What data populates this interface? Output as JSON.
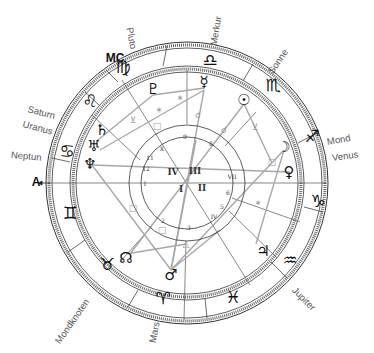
{
  "chart_title": "",
  "planet_labels": [
    {
      "id": "pluto",
      "label": "Pluto",
      "x": 130,
      "y": 22,
      "rot": 80
    },
    {
      "id": "merkur",
      "label": "Merkur",
      "x": 213,
      "y": 40,
      "rot": -80
    },
    {
      "id": "sonne",
      "label": "Sonne",
      "x": 270,
      "y": 67,
      "rot": -55
    },
    {
      "id": "mond",
      "label": "Mond",
      "x": 327,
      "y": 136,
      "rot": -10
    },
    {
      "id": "venus",
      "label": "Venus",
      "x": 332,
      "y": 152,
      "rot": -8
    },
    {
      "id": "saturn",
      "label": "Saturn",
      "x": 28,
      "y": 103,
      "rot": 15
    },
    {
      "id": "uranus",
      "label": "Uranus",
      "x": 23,
      "y": 118,
      "rot": 15
    },
    {
      "id": "neptun",
      "label": "Neptun",
      "x": 11,
      "y": 149,
      "rot": 5
    },
    {
      "id": "mondknoten",
      "label": "Mondknoten",
      "x": 57,
      "y": 337,
      "rot": -55
    },
    {
      "id": "mars",
      "label": "Mars",
      "x": 152,
      "y": 337,
      "rot": -78
    },
    {
      "id": "jupiter",
      "label": "Jupiter",
      "x": 294,
      "y": 283,
      "rot": 45
    }
  ],
  "angles": [
    {
      "id": "mc",
      "label": "MC",
      "x": 115,
      "y": 58
    },
    {
      "id": "asc",
      "label": "A",
      "x": 36,
      "y": 182
    }
  ],
  "zodiac_signs": [
    {
      "id": "virgo",
      "glyph": "♍",
      "x": 123,
      "y": 67
    },
    {
      "id": "libra",
      "glyph": "♎",
      "x": 210,
      "y": 60
    },
    {
      "id": "scorpio",
      "glyph": "♏",
      "x": 273,
      "y": 85
    },
    {
      "id": "sagittarius",
      "glyph": "♐",
      "x": 312,
      "y": 136
    },
    {
      "id": "capricorn",
      "glyph": "♑",
      "x": 318,
      "y": 201
    },
    {
      "id": "aquarius",
      "glyph": "♒",
      "x": 290,
      "y": 260
    },
    {
      "id": "pisces",
      "glyph": "♓",
      "x": 233,
      "y": 297
    },
    {
      "id": "aries",
      "glyph": "♈",
      "x": 163,
      "y": 298
    },
    {
      "id": "taurus",
      "glyph": "♉",
      "x": 107,
      "y": 264
    },
    {
      "id": "gemini",
      "glyph": "♊",
      "x": 70,
      "y": 213
    },
    {
      "id": "cancer",
      "glyph": "♋",
      "x": 67,
      "y": 151
    },
    {
      "id": "leo",
      "glyph": "♌",
      "x": 90,
      "y": 101
    }
  ],
  "planets": [
    {
      "id": "pluto",
      "glyph": "♇",
      "x": 153,
      "y": 89
    },
    {
      "id": "mercury",
      "glyph": "☿",
      "x": 204,
      "y": 82
    },
    {
      "id": "sun",
      "glyph": "☉",
      "x": 244,
      "y": 100
    },
    {
      "id": "moon",
      "glyph": "☽",
      "x": 284,
      "y": 147
    },
    {
      "id": "venus",
      "glyph": "♀",
      "x": 289,
      "y": 172
    },
    {
      "id": "saturn",
      "glyph": "♄",
      "x": 102,
      "y": 130
    },
    {
      "id": "uranus",
      "glyph": "♅",
      "x": 94,
      "y": 146
    },
    {
      "id": "neptune",
      "glyph": "♆",
      "x": 90,
      "y": 164
    },
    {
      "id": "node",
      "glyph": "☊",
      "x": 126,
      "y": 258
    },
    {
      "id": "mars",
      "glyph": "♂",
      "x": 171,
      "y": 275
    },
    {
      "id": "jupiter",
      "glyph": "♃",
      "x": 263,
      "y": 251
    }
  ],
  "house_numbers": [
    {
      "n": "1",
      "label": "I",
      "x": 145,
      "y": 183
    },
    {
      "n": "2",
      "label": "2",
      "x": 163,
      "y": 220
    },
    {
      "n": "3",
      "label": "3",
      "x": 189,
      "y": 227
    },
    {
      "n": "4",
      "label": "IV",
      "x": 214,
      "y": 216
    },
    {
      "n": "5",
      "label": "5",
      "x": 222,
      "y": 206
    },
    {
      "n": "6",
      "label": "6",
      "x": 228,
      "y": 192
    },
    {
      "n": "7",
      "label": "VII",
      "x": 232,
      "y": 176
    },
    {
      "n": "8",
      "label": "8",
      "x": 211,
      "y": 143
    },
    {
      "n": "9",
      "label": "9",
      "x": 185,
      "y": 136
    },
    {
      "n": "10",
      "label": "X",
      "x": 162,
      "y": 148
    },
    {
      "n": "11",
      "label": "11",
      "x": 150,
      "y": 157
    },
    {
      "n": "12",
      "label": "12",
      "x": 146,
      "y": 168
    }
  ],
  "quadrants": [
    {
      "id": "q1",
      "label": "I",
      "x": 181,
      "y": 189
    },
    {
      "id": "q2",
      "label": "II",
      "x": 202,
      "y": 188
    },
    {
      "id": "q3",
      "label": "III",
      "x": 195,
      "y": 171
    },
    {
      "id": "q4",
      "label": "IV",
      "x": 173,
      "y": 172
    }
  ],
  "aspect_markers": [
    {
      "type": "sextile",
      "glyph": "✶",
      "x": 180,
      "y": 98
    },
    {
      "type": "sextile",
      "glyph": "✶",
      "x": 159,
      "y": 110
    },
    {
      "type": "semisextile",
      "glyph": "⊻",
      "x": 133,
      "y": 120
    },
    {
      "type": "square",
      "glyph": "□",
      "x": 157,
      "y": 126
    },
    {
      "type": "conjunction",
      "glyph": "☌",
      "x": 198,
      "y": 115
    },
    {
      "type": "conjunction",
      "glyph": "☌",
      "x": 224,
      "y": 130
    },
    {
      "type": "semisextile",
      "glyph": "⊻",
      "x": 255,
      "y": 127
    },
    {
      "type": "square",
      "glyph": "□",
      "x": 272,
      "y": 162
    },
    {
      "type": "sextile",
      "glyph": "✶",
      "x": 258,
      "y": 203
    },
    {
      "type": "square",
      "glyph": "□",
      "x": 133,
      "y": 208
    },
    {
      "type": "square",
      "glyph": "□",
      "x": 162,
      "y": 230
    },
    {
      "type": "trine",
      "glyph": "△",
      "x": 186,
      "y": 244
    }
  ],
  "colors": {
    "ink": "#111111",
    "line": "#555555",
    "aspect_line": "#a8a8a8",
    "label": "#555555"
  }
}
